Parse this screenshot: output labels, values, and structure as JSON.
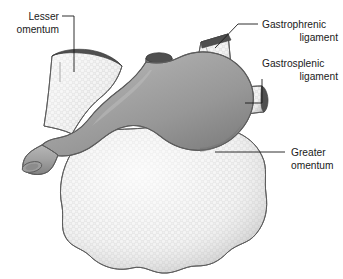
{
  "figure": {
    "title_visible": false,
    "type": "anatomical-illustration"
  },
  "labels": [
    {
      "id": "lesser-omentum",
      "line1": "Lesser",
      "line2": "omentum",
      "align": "right",
      "x": 60,
      "y": 18
    },
    {
      "id": "gastrophrenic-ligament",
      "line1": "Gastrophrenic",
      "line2": "ligament",
      "align": "left",
      "x": 262,
      "y": 26
    },
    {
      "id": "gastrosplenic-ligament",
      "line1": "Gastrosplenic",
      "line2": "ligament",
      "align": "left",
      "x": 262,
      "y": 64
    },
    {
      "id": "greater-omentum",
      "line1": "Greater",
      "line2": "omentum",
      "align": "left",
      "x": 289,
      "y": 154
    }
  ],
  "structures": {
    "stomach": "stomach-body",
    "esophagus": "esophagus-stump",
    "duodenum": "duodenum-stump",
    "lesser_omentum": "lesser-omentum-sheet",
    "gastrophrenic_ligament": "gastrophrenic-ligament-sheet",
    "gastrosplenic_ligament": "gastrosplenic-ligament-sheet",
    "greater_omentum": "greater-omentum-apron"
  },
  "colors": {
    "stomach_fill": "#9a9a9a",
    "stomach_highlight": "#b4b4b4",
    "stomach_shadow": "#7d7d7d",
    "omentum_fill": "#e6e6e6",
    "omentum_shadow": "#c2c2c2",
    "cut_edge": "#4f4f4f",
    "outline": "#5c5c5c",
    "label_text": "#1a1a1a",
    "background": "#ffffff"
  }
}
